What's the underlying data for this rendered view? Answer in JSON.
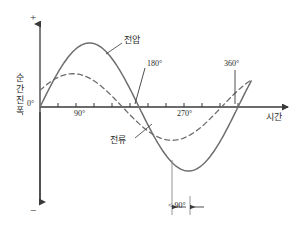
{
  "chart_data": {
    "type": "line",
    "title": "",
    "xlabel": "시간",
    "ylabel": "순간 진폭",
    "xlim": [
      0,
      400
    ],
    "ylim": [
      -1.15,
      1.15
    ],
    "grid": false,
    "legend": "inline-annotations",
    "x_tick_labels": [
      "0°",
      "90°",
      "180°",
      "270°",
      "360°"
    ],
    "x_tick_values": [
      0,
      90,
      180,
      270,
      360
    ],
    "x_minor_tick_step": 30,
    "y_axis_markers": {
      "positive": "+",
      "negative": "−",
      "origin": "0°"
    },
    "series": [
      {
        "name": "전압",
        "style": "solid",
        "color": "#6e6e6e",
        "amplitude": 1.0,
        "phase_deg": 0,
        "peak_at_deg": 90,
        "trough_at_deg": 270,
        "zero_crossings_deg": [
          0,
          180,
          360
        ]
      },
      {
        "name": "전류",
        "style": "dashed",
        "color": "#6e6e6e",
        "amplitude": 0.52,
        "phase_deg": 30,
        "peak_at_deg": 60,
        "trough_at_deg": 240,
        "zero_crossings_deg": [
          150,
          330
        ]
      }
    ],
    "annotations": [
      {
        "name": "voltage-label",
        "text": "전압",
        "points_to": "solid-curve"
      },
      {
        "name": "current-label",
        "text": "전류",
        "points_to": "dashed-curve"
      },
      {
        "name": "phase-difference",
        "text": "< 90°",
        "from_deg": 240,
        "to_deg": 270
      },
      {
        "name": "tick-leader-180",
        "text": "180°",
        "at_deg": 180
      },
      {
        "name": "tick-leader-360",
        "text": "360°",
        "at_deg": 360
      }
    ]
  },
  "axes": {
    "y_plus": "+",
    "y_minus": "−",
    "y_origin": "0°",
    "y_title_chars": [
      "순",
      "간",
      "진",
      "폭"
    ],
    "x_title": "시간"
  },
  "labels": {
    "deg_90": "90°",
    "deg_180": "180°",
    "deg_270": "270°",
    "deg_360": "360°",
    "voltage": "전압",
    "current": "전류",
    "phase_diff": "< 90°"
  },
  "colors": {
    "curve": "#6e6e6e",
    "axis": "#3a3a3a",
    "text": "#2b2b2b",
    "background": "#ffffff"
  }
}
